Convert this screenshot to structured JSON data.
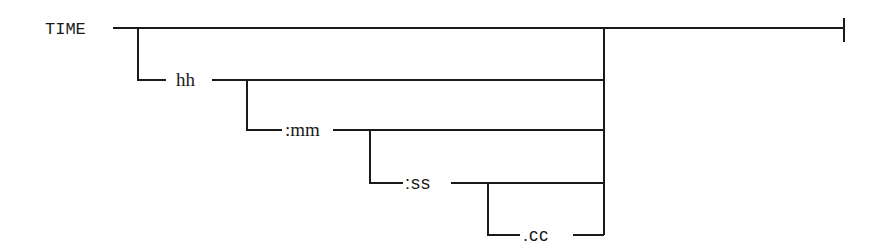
{
  "diagram": {
    "type": "railroad-syntax-diagram",
    "keyword": "TIME",
    "tokens": [
      {
        "id": "hh",
        "label": "hh",
        "optional": true
      },
      {
        "id": "mm",
        "label": ":mm",
        "optional": true
      },
      {
        "id": "ss",
        "label": ":ss",
        "optional": true
      },
      {
        "id": "cc",
        "label": ".cc",
        "optional": true
      }
    ],
    "terminator": "end-bar",
    "line_color": "#1a1a1a",
    "background": "#ffffff"
  }
}
